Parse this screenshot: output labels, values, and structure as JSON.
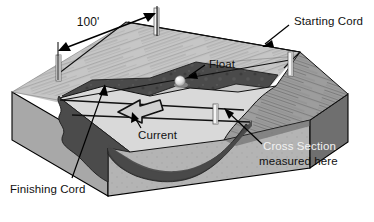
{
  "figure": {
    "type": "block-diagram",
    "width": 374,
    "height": 222,
    "background_color": "#ffffff"
  },
  "labels": {
    "reach_length": "100'",
    "starting_cord": "Starting Cord",
    "finishing_cord": "Finishing Cord",
    "float": "Float",
    "current": "Current",
    "cross_section_line1": "Cross Section",
    "cross_section_line2": "measured here"
  },
  "colors": {
    "outline": "#000000",
    "water_surface": "#d9d9d9",
    "bank_top_light": "#c4c4c4",
    "bank_top_mid": "#9a9a9a",
    "channel_dark": "#4f4f4f",
    "channel_darker": "#3d3d3d",
    "block_left_face": "#a8a8a8",
    "block_front_face": "#b2b2b2",
    "block_right_face": "#6f6f6f",
    "stake_white": "#f4f4f4",
    "stake_shadow": "#8a8a8a",
    "float_highlight": "#ededed",
    "label_text": "#111111"
  },
  "elements": {
    "stakes_count": 4,
    "cords_count": 2,
    "float_count": 1,
    "current_arrow_direction": "left",
    "dimension_arrow": "double-headed"
  }
}
